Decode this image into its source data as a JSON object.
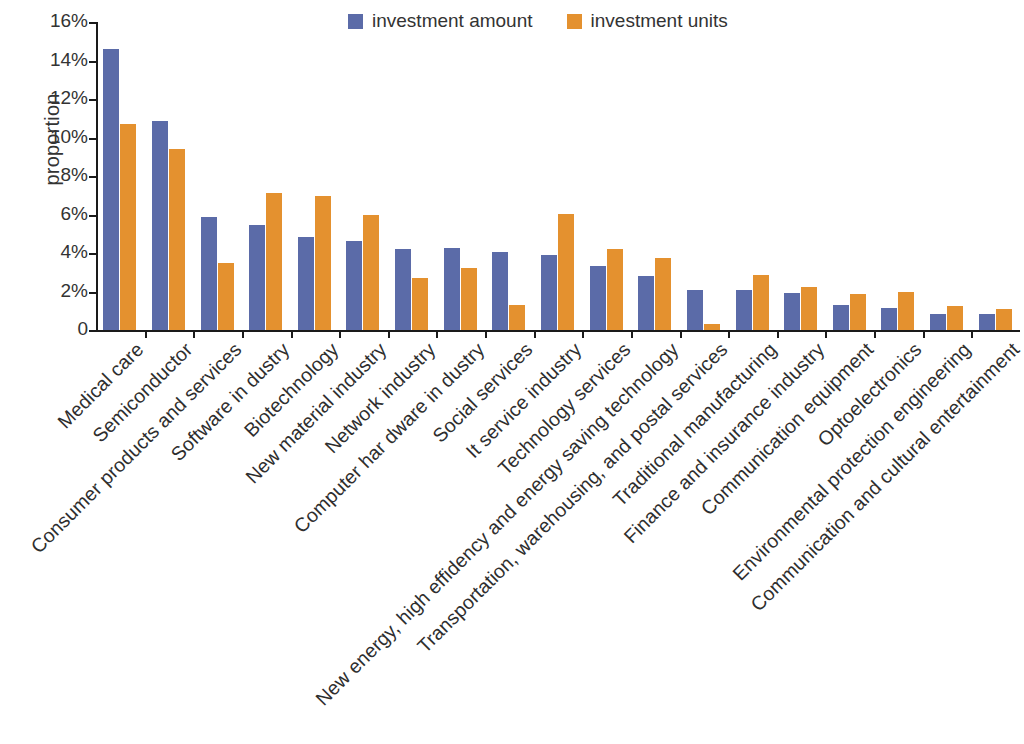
{
  "chart_data": {
    "type": "bar",
    "title": "",
    "subtitle": "",
    "xlabel": "",
    "ylabel": "proportion",
    "ylim": [
      0,
      16
    ],
    "yticks": [
      "0",
      "2%",
      "4%",
      "6%",
      "8%",
      "10%",
      "12%",
      "14%",
      "16%"
    ],
    "ytick_values": [
      0,
      2,
      4,
      6,
      8,
      10,
      12,
      14,
      16
    ],
    "grid": false,
    "legend_position": "top-center",
    "unit": "%",
    "categories": [
      "Medical care",
      "Semiconductor",
      "Consumer products and services",
      "Software in dustry",
      "Biotechnology",
      "New material industry",
      "Network industry",
      "Computer har dware in dustry",
      "Social services",
      "It service industry",
      "Technology services",
      "New energy, high effidency and energy saving technology",
      "Transportation, warehousing, and postal services",
      "Traditional manufacturing",
      "Finance and insurance industry",
      "Communication equipment",
      "Optoelectronics",
      "Environmental  protection engineering",
      "Communication and cultural entertainment"
    ],
    "series": [
      {
        "name": "investment amount",
        "color": "#5b6ba8",
        "values": [
          14.6,
          10.85,
          5.85,
          5.45,
          4.85,
          4.6,
          4.2,
          4.25,
          4.05,
          3.9,
          3.35,
          2.8,
          2.1,
          2.1,
          1.9,
          1.3,
          1.15,
          0.85,
          0.85
        ]
      },
      {
        "name": "investment units",
        "color": "#e4912f",
        "values": [
          10.7,
          9.4,
          3.5,
          7.1,
          6.95,
          5.95,
          2.7,
          3.2,
          1.3,
          6.05,
          4.2,
          3.75,
          0.3,
          2.85,
          2.25,
          1.85,
          2.0,
          1.25,
          1.1
        ]
      }
    ]
  }
}
